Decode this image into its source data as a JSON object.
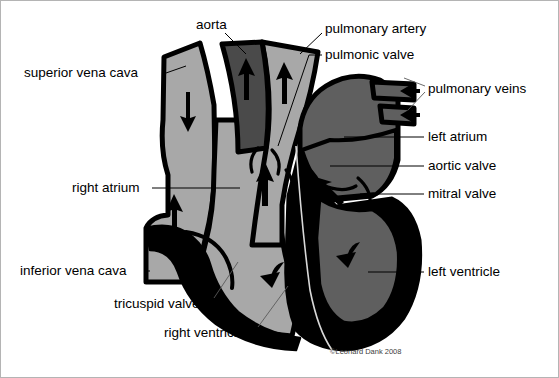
{
  "figure": {
    "credit": "©Leonard Dank 2008",
    "background_color": "#ffffff",
    "frame_color": "#b4b4b4"
  },
  "colors": {
    "light_gray": "#a8a8a8",
    "mid_gray": "#5f5f5f",
    "dark_gray": "#4a4a4a",
    "myocardium_black": "#000000",
    "outline_black": "#000000",
    "white": "#ffffff",
    "label_text": "#000000",
    "credit_text": "#404040"
  },
  "labels": [
    {
      "id": "aorta",
      "text": "aorta",
      "x": 196,
      "y": 25,
      "anchor": "start"
    },
    {
      "id": "pulmonary-artery",
      "text": "pulmonary artery",
      "x": 325,
      "y": 29,
      "anchor": "start"
    },
    {
      "id": "pulmonic-valve",
      "text": "pulmonic valve",
      "x": 325,
      "y": 55,
      "anchor": "start"
    },
    {
      "id": "superior-vena-cava",
      "text": "superior vena cava",
      "x": 24,
      "y": 73,
      "anchor": "start"
    },
    {
      "id": "pulmonary-veins",
      "text": "pulmonary veins",
      "x": 428,
      "y": 89,
      "anchor": "start"
    },
    {
      "id": "left-atrium",
      "text": "left atrium",
      "x": 428,
      "y": 137,
      "anchor": "start"
    },
    {
      "id": "aortic-valve",
      "text": "aortic valve",
      "x": 428,
      "y": 166,
      "anchor": "start"
    },
    {
      "id": "mitral-valve",
      "text": "mitral valve",
      "x": 428,
      "y": 194,
      "anchor": "start"
    },
    {
      "id": "right-atrium",
      "text": "right atrium",
      "x": 72,
      "y": 188,
      "anchor": "start"
    },
    {
      "id": "inferior-vena-cava",
      "text": "inferior vena cava",
      "x": 20,
      "y": 271,
      "anchor": "start"
    },
    {
      "id": "left-ventricle",
      "text": "left ventricle",
      "x": 428,
      "y": 272,
      "anchor": "start"
    },
    {
      "id": "tricuspid-valve",
      "text": "tricuspid valve",
      "x": 114,
      "y": 304,
      "anchor": "start"
    },
    {
      "id": "right-ventricle",
      "text": "right ventricle",
      "x": 164,
      "y": 333,
      "anchor": "start"
    }
  ],
  "structures": [
    {
      "id": "aorta",
      "label": "aorta",
      "fill": "dark_gray",
      "blood": "oxygenated"
    },
    {
      "id": "pulmonary-artery",
      "label": "pulmonary artery",
      "fill": "light_gray",
      "blood": "deoxygenated"
    },
    {
      "id": "superior-vena-cava",
      "label": "superior vena cava",
      "fill": "light_gray",
      "blood": "deoxygenated"
    },
    {
      "id": "inferior-vena-cava",
      "label": "inferior vena cava",
      "fill": "light_gray",
      "blood": "deoxygenated"
    },
    {
      "id": "right-atrium",
      "label": "right atrium",
      "fill": "light_gray",
      "blood": "deoxygenated"
    },
    {
      "id": "right-ventricle",
      "label": "right ventricle",
      "fill": "light_gray",
      "blood": "deoxygenated"
    },
    {
      "id": "left-atrium",
      "label": "left atrium",
      "fill": "mid_gray",
      "blood": "oxygenated"
    },
    {
      "id": "left-ventricle",
      "label": "left ventricle",
      "fill": "mid_gray",
      "blood": "oxygenated"
    },
    {
      "id": "pulmonary-veins",
      "label": "pulmonary veins",
      "fill": "mid_gray",
      "blood": "oxygenated"
    }
  ],
  "valves": [
    {
      "id": "pulmonic-valve",
      "label": "pulmonic valve"
    },
    {
      "id": "aortic-valve",
      "label": "aortic valve"
    },
    {
      "id": "tricuspid-valve",
      "label": "tricuspid valve"
    },
    {
      "id": "mitral-valve",
      "label": "mitral valve"
    }
  ],
  "flow_arrows": [
    {
      "id": "svc-inflow",
      "direction": "down",
      "chamber": "superior vena cava"
    },
    {
      "id": "aorta-outflow",
      "direction": "up",
      "chamber": "aorta"
    },
    {
      "id": "pulmonary-artery-outflow",
      "direction": "up",
      "chamber": "pulmonary artery"
    },
    {
      "id": "right-atrium-to-ventricle",
      "direction": "up",
      "chamber": "right atrium"
    },
    {
      "id": "ivc-inflow",
      "direction": "up",
      "chamber": "inferior vena cava"
    },
    {
      "id": "right-ventricle-outflow",
      "direction": "curved-up",
      "chamber": "right ventricle"
    },
    {
      "id": "pulmonary-vein-inflow-upper",
      "direction": "left",
      "chamber": "pulmonary vein"
    },
    {
      "id": "pulmonary-vein-inflow-lower",
      "direction": "left",
      "chamber": "pulmonary vein"
    },
    {
      "id": "left-atrium-to-ventricle",
      "direction": "up-left",
      "chamber": "left atrium"
    },
    {
      "id": "left-ventricle-outflow",
      "direction": "curved-up",
      "chamber": "left ventricle"
    }
  ]
}
